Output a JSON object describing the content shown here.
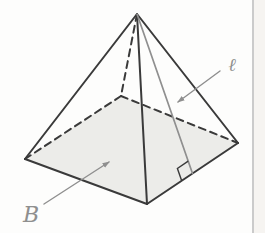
{
  "diagram": {
    "type": "geometry-figure",
    "labels": {
      "base": "B",
      "slant_height": "ℓ"
    },
    "colors": {
      "edge": "#3a3a3a",
      "accent": "#8f8f8f",
      "base_fill": "#ecece9",
      "background": "#fdfdfc",
      "page_edge": "#cbcbcb",
      "page_margin": "#f6f4f1"
    },
    "vertices": {
      "apex": [
        137,
        14
      ],
      "base_left": [
        25,
        159
      ],
      "base_back": [
        121,
        96
      ],
      "base_right": [
        238,
        143
      ],
      "base_front": [
        147,
        204
      ]
    },
    "slant_foot": [
      192.5,
      173.5
    ],
    "right_angle_marker_size": 13,
    "annotations": {
      "b_arrow": {
        "from": [
          44,
          204
        ],
        "to": [
          109,
          162
        ]
      },
      "l_arrow": {
        "from": [
          220,
          71
        ],
        "to": [
          178,
          102
        ]
      },
      "b_label_pos": [
        31,
        222
      ],
      "l_label_pos": [
        232,
        71
      ]
    }
  }
}
